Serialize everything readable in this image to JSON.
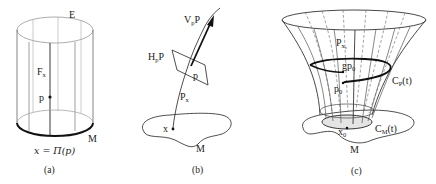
{
  "figure": {
    "panels": [
      {
        "id": "a",
        "caption": "(a)",
        "labels": {
          "total_space": "E",
          "fiber": "F",
          "fiber_sub": "x",
          "point": "p",
          "base": "M",
          "projection_eq": "x = Π(p)"
        }
      },
      {
        "id": "b",
        "caption": "(b)",
        "labels": {
          "vertical_space": "V",
          "vertical_sub": "p",
          "vertical_suffix": "P",
          "horizontal_space": "H",
          "horizontal_sub": "p",
          "horizontal_suffix": "P",
          "point": "p",
          "fiber": "P",
          "fiber_sub": "x",
          "base_point": "x",
          "base": "M"
        }
      },
      {
        "id": "c",
        "caption": "(c)",
        "labels": {
          "fiber": "P",
          "fiber_sub": "x₀",
          "translated_point": "gp",
          "translated_sub": "0",
          "start_point": "p",
          "start_sub": "0",
          "horizontal_lift": "C",
          "horizontal_lift_sub": "P",
          "horizontal_lift_arg": "(t)",
          "base_point": "x",
          "base_point_sub": "0",
          "base_curve": "C",
          "base_curve_sub": "M",
          "base_curve_arg": "(t)",
          "base": "M"
        }
      }
    ]
  }
}
